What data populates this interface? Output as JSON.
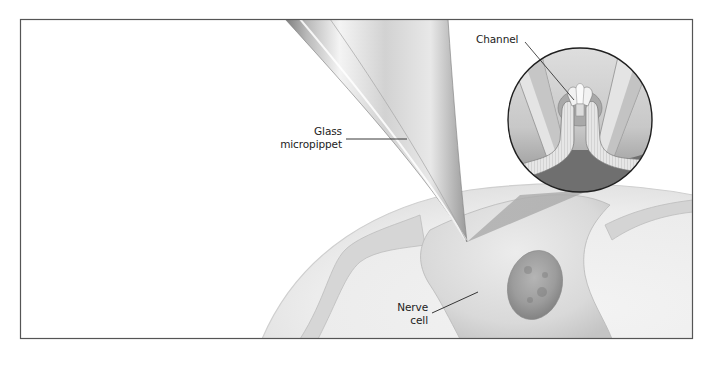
{
  "figure": {
    "type": "scientific illustration",
    "colors": {
      "frame": "#555555",
      "background": "#ffffff",
      "cell_fill": "#e2e2e2",
      "nucleus": "#9a9a9a",
      "pipette_light": "#f2f2f2",
      "pipette_dark": "#8a8a8a",
      "label_text": "#222222"
    }
  },
  "labels": {
    "pipette": {
      "line1": "Glass",
      "line2": "micropippet"
    },
    "channel": {
      "text": "Channel"
    },
    "cell": {
      "line1": "Nerve",
      "line2": "cell"
    }
  }
}
